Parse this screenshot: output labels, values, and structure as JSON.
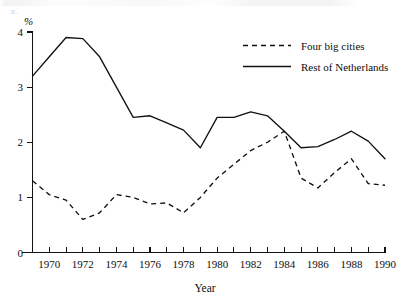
{
  "chart_data": {
    "type": "line",
    "title": "",
    "xlabel": "Year",
    "ylabel": "",
    "unit_label": "%",
    "xlim": [
      1969,
      1990
    ],
    "ylim": [
      0,
      4
    ],
    "grid": false,
    "legend_position": "top-right",
    "x": [
      1969,
      1970,
      1971,
      1972,
      1973,
      1974,
      1975,
      1976,
      1977,
      1978,
      1979,
      1980,
      1981,
      1982,
      1983,
      1984,
      1985,
      1986,
      1987,
      1988,
      1989,
      1990
    ],
    "xticks_major": [
      1970,
      1972,
      1974,
      1976,
      1978,
      1980,
      1982,
      1984,
      1986,
      1988,
      1990
    ],
    "xtick_labels": [
      "1970",
      "1972",
      "1974",
      "1976",
      "1978",
      "1980",
      "1982",
      "1984",
      "1986",
      "1988",
      "1990"
    ],
    "xticks_all": [
      1969,
      1970,
      1971,
      1972,
      1973,
      1974,
      1975,
      1976,
      1977,
      1978,
      1979,
      1980,
      1981,
      1982,
      1983,
      1984,
      1985,
      1986,
      1987,
      1988,
      1989,
      1990
    ],
    "yticks": [
      0,
      1,
      2,
      3,
      4
    ],
    "ytick_labels": [
      "0",
      "1",
      "2",
      "3",
      "4"
    ],
    "series": [
      {
        "name": "Four big cities",
        "style": "dashed",
        "color": "#111111",
        "values": [
          1.3,
          1.05,
          0.95,
          0.6,
          0.72,
          1.05,
          1.0,
          0.88,
          0.9,
          0.72,
          1.0,
          1.35,
          1.6,
          1.85,
          2.0,
          2.2,
          1.35,
          1.17,
          1.45,
          1.7,
          1.25,
          1.22
        ]
      },
      {
        "name": "Rest of Netherlands",
        "style": "solid",
        "color": "#111111",
        "values": [
          3.2,
          3.55,
          3.9,
          3.88,
          3.55,
          3.0,
          2.45,
          2.48,
          2.35,
          2.22,
          1.9,
          2.45,
          2.45,
          2.55,
          2.48,
          2.2,
          1.9,
          1.92,
          2.05,
          2.2,
          2.02,
          1.7
        ]
      }
    ]
  },
  "legend": {
    "items": [
      {
        "label": "Four big cities",
        "style": "dashed"
      },
      {
        "label": "Rest of Netherlands",
        "style": "solid"
      }
    ]
  },
  "artifact": {
    "glyph": "a."
  }
}
